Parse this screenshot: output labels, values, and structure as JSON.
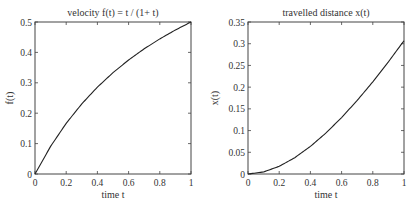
{
  "chart_data": [
    {
      "type": "line",
      "title": "velocity f(t) = t / (1+ t)",
      "xlabel": "time t",
      "ylabel": "f(t)",
      "xlim": [
        0,
        1
      ],
      "ylim": [
        0,
        0.5
      ],
      "x_ticks": [
        "0",
        "0.2",
        "0.4",
        "0.6",
        "0.8",
        "1"
      ],
      "y_ticks": [
        "0",
        "0.1",
        "0.2",
        "0.3",
        "0.4",
        "0.5"
      ],
      "grid": false,
      "series": [
        {
          "name": "f(t)",
          "x": [
            0,
            0.1,
            0.2,
            0.3,
            0.4,
            0.5,
            0.6,
            0.7,
            0.8,
            0.9,
            1.0
          ],
          "y": [
            0,
            0.0909,
            0.1667,
            0.2308,
            0.2857,
            0.3333,
            0.375,
            0.4118,
            0.4444,
            0.4737,
            0.5
          ]
        }
      ]
    },
    {
      "type": "line",
      "title": "travelled distance x(t)",
      "xlabel": "time t",
      "ylabel": "x(t)",
      "xlim": [
        0,
        1
      ],
      "ylim": [
        0,
        0.35
      ],
      "x_ticks": [
        "0",
        "0.2",
        "0.4",
        "0.6",
        "0.8",
        "1"
      ],
      "y_ticks": [
        "0",
        "0.05",
        "0.1",
        "0.15",
        "0.2",
        "0.25",
        "0.3",
        "0.35"
      ],
      "grid": false,
      "series": [
        {
          "name": "x(t)",
          "x": [
            0,
            0.1,
            0.2,
            0.3,
            0.4,
            0.5,
            0.6,
            0.7,
            0.8,
            0.9,
            1.0
          ],
          "y": [
            0,
            0.0047,
            0.0177,
            0.0376,
            0.0635,
            0.0945,
            0.13,
            0.1694,
            0.2122,
            0.2582,
            0.3069
          ]
        }
      ]
    }
  ]
}
